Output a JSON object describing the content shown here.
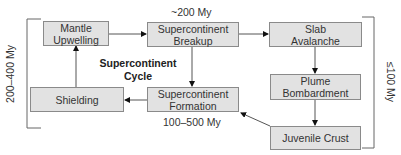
{
  "diagram": {
    "title_line1": "Supercontinent",
    "title_line2": "Cycle",
    "nodes": {
      "mantle_upwelling": {
        "line1": "Mantle",
        "line2": "Upwelling"
      },
      "supercontinent_breakup": {
        "line1": "Supercontinent",
        "line2": "Breakup"
      },
      "slab_avalanche": {
        "line1": "Slab",
        "line2": "Avalanche"
      },
      "plume_bombardment": {
        "line1": "Plume",
        "line2": "Bombardment"
      },
      "juvenile_crust": {
        "line1": "Juvenile Crust"
      },
      "supercontinent_formation": {
        "line1": "Supercontinent",
        "line2": "Formation"
      },
      "shielding": {
        "line1": "Shielding"
      }
    },
    "annotations": {
      "breakup_time": "~200 My",
      "formation_time": "100–500 My",
      "left_bracket": "200–400 My",
      "right_bracket": "≤100 My"
    },
    "edges": [
      {
        "from": "Mantle Upwelling",
        "to": "Supercontinent Breakup"
      },
      {
        "from": "Supercontinent Breakup",
        "to": "Slab Avalanche"
      },
      {
        "from": "Slab Avalanche",
        "to": "Plume Bombardment"
      },
      {
        "from": "Plume Bombardment",
        "to": "Juvenile Crust"
      },
      {
        "from": "Juvenile Crust",
        "to": "Supercontinent Formation"
      },
      {
        "from": "Supercontinent Breakup",
        "to": "Supercontinent Formation"
      },
      {
        "from": "Supercontinent Formation",
        "to": "Shielding"
      },
      {
        "from": "Shielding",
        "to": "Mantle Upwelling"
      }
    ],
    "colors": {
      "box_fill": "#e2e2e2",
      "box_border": "#8a8a8a",
      "line": "#555555"
    }
  }
}
